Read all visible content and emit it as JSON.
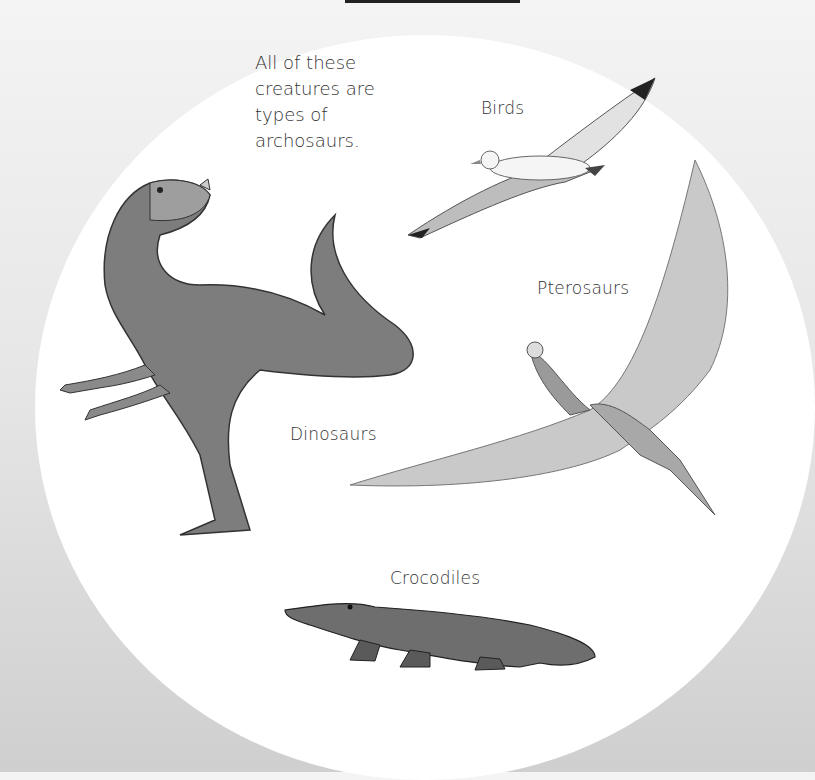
{
  "intro_text": {
    "lines": [
      "All of these",
      "creatures are",
      "types of",
      "archosaurs."
    ]
  },
  "labels": {
    "birds": "Birds",
    "pterosaurs": "Pterosaurs",
    "dinosaurs": "Dinosaurs",
    "crocodiles": "Crocodiles"
  },
  "illustrations": [
    {
      "name": "bird",
      "description": "seagull in flight"
    },
    {
      "name": "pterosaur",
      "description": "pteranodon with wings spread"
    },
    {
      "name": "dinosaur",
      "description": "ceratosaurus standing"
    },
    {
      "name": "crocodile",
      "description": "crocodile walking"
    }
  ],
  "colors": {
    "background_top": "#f4f4f4",
    "background_bottom": "#cfcfcf",
    "circle": "#ffffff",
    "text": "#333333",
    "top_bar": "#222222"
  }
}
